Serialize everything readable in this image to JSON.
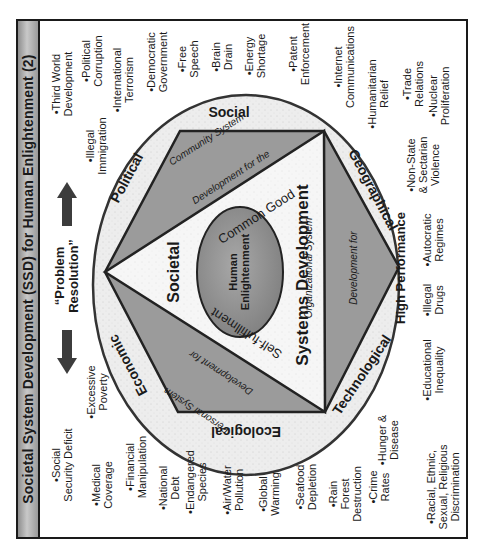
{
  "title": "Societal System Development (SSD) for Human Enlightenment (2)",
  "colors": {
    "frame": "#1a1a1a",
    "title_bar": "#b0b0b0",
    "ring_fill": "#ececec",
    "segment_fill": "#9a9a9a",
    "triangle_fill": "#f4f4f4",
    "center_fill": "#8c8c8c",
    "arrow": "#404040"
  },
  "problem_resolution": {
    "label": "“Problem\nResolution”",
    "up_arrow_icon": "arrow-up",
    "down_arrow_icon": "arrow-down"
  },
  "ring_labels": {
    "social": "Social",
    "political": "Political",
    "economic": "Economic",
    "ecological": "Ecological",
    "technological": "Technological",
    "geographical": "Geographical"
  },
  "segments": {
    "community": {
      "line1": "Community System",
      "line2": "Development for the",
      "line3": "Common Good"
    },
    "personal": {
      "line1": "Personal System",
      "line2": "Development for",
      "line3": "Self-fulfillment"
    },
    "organizational": {
      "line1": "Organizational System",
      "line2": "Development for",
      "line3": "High Performance"
    }
  },
  "triangle_labels": {
    "societal": "Societal",
    "systems_development": "Systems Development"
  },
  "center": {
    "label": "Human\nEnlightenment"
  },
  "issues": {
    "top": [
      "•Third World\nDevelopment",
      "•Political\nCorruption",
      "•Illegal\nImmigration",
      "•International\nTerrorism",
      "•Democratic\nGovernment",
      "•Free\nSpeech",
      "•Brain\nDrain",
      "•Energy\nShortage",
      "•Patent\nEnforcement",
      "•Internet\nCommunications",
      "•Humanitarian\nRelief",
      "•Trade\nRelations",
      "•Nuclear\nProliferation"
    ],
    "right": [
      "•Non-State\n& Sectarian\nViolence",
      "•Autocratic\nRegimes",
      "•Illegal\nDrugs",
      "•Educational\nInequality"
    ],
    "bottom": [
      "•Social\nSecurity Deficit",
      "•Excessive\nPoverty",
      "•Medical\nCoverage",
      "•Financial\nManipulation",
      "•National\nDebt",
      "•Endangered\nSpecies",
      "•Air/Water\nPollution",
      "•Global\nWarming",
      "•Seafood\nDepletion",
      "•Rain\nForest\nDestruction",
      "•Crime\nRates",
      "•Hunger &\nDisease",
      "•Racial, Ethnic,\nSexual, Religious\nDiscrimination"
    ]
  }
}
